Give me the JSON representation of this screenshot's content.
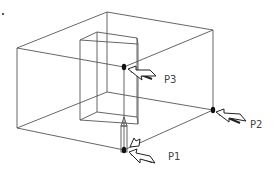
{
  "diagram": {
    "type": "isometric-box-with-inner-block",
    "colors": {
      "line": "#555555",
      "point": "#111111",
      "label": "#444444",
      "background": "#ffffff"
    },
    "points": [
      {
        "id": "P1",
        "label": "P1"
      },
      {
        "id": "P2",
        "label": "P2"
      },
      {
        "id": "P3",
        "label": "P3"
      }
    ]
  }
}
